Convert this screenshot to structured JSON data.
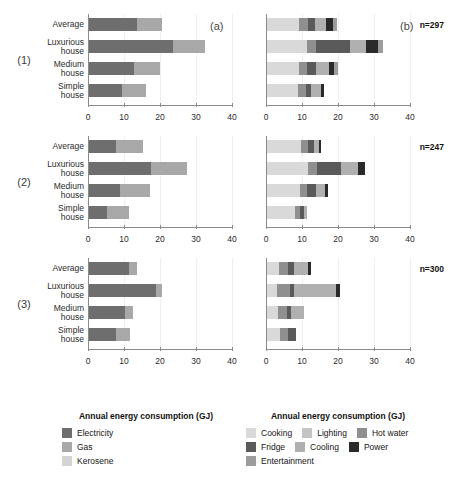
{
  "chart_data": {
    "type": "bar",
    "title": "",
    "xlabel": "Annual energy consumption (GJ)",
    "ylabel": "",
    "xlim": [
      0,
      40
    ],
    "xticks": [
      0,
      10,
      20,
      30,
      40
    ],
    "categories": [
      "Average",
      "Luxurious\nhouse",
      "Medium\nhouse",
      "Simple\nhouse"
    ],
    "grid": false,
    "legend_position": "bottom",
    "panel_tags": [
      "(a)",
      "(b)"
    ],
    "groups": [
      {
        "id": "(1)",
        "n_label": "n=297",
        "panel_a": {
          "tag": "(a)",
          "stacks": [
            "Electricity",
            "Gas",
            "Kerosene"
          ],
          "values": [
            [
              13.2,
              7.2,
              0.0
            ],
            [
              23.3,
              8.9,
              0.0
            ],
            [
              12.4,
              7.2,
              0.0
            ],
            [
              9.1,
              6.7,
              0.0
            ]
          ],
          "totals": [
            20.4,
            32.2,
            19.6,
            15.8
          ]
        },
        "panel_b": {
          "tag": "(b)",
          "stacks": [
            "Cooking",
            "Lighting",
            "Hot water",
            "Fridge",
            "Cooling",
            "Power",
            "Entertainment"
          ],
          "values": [
            [
              9.0,
              0.0,
              2.3,
              2.0,
              3.2,
              1.9,
              1.0
            ],
            [
              11.2,
              0.0,
              2.4,
              9.4,
              4.6,
              3.3,
              1.3
            ],
            [
              8.8,
              0.0,
              2.3,
              2.5,
              3.5,
              1.6,
              0.9
            ],
            [
              8.7,
              0.0,
              2.0,
              1.6,
              2.6,
              0.9,
              0.0
            ]
          ],
          "totals": [
            19.4,
            32.2,
            19.6,
            15.8
          ]
        }
      },
      {
        "id": "(2)",
        "n_label": "n=247",
        "panel_a": {
          "tag": "",
          "stacks": [
            "Electricity",
            "Gas",
            "Kerosene"
          ],
          "values": [
            [
              7.5,
              7.6,
              0.0
            ],
            [
              17.2,
              10.0,
              0.0
            ],
            [
              8.6,
              8.3,
              0.0
            ],
            [
              5.1,
              6.0,
              0.0
            ]
          ],
          "totals": [
            15.1,
            27.2,
            16.9,
            11.1
          ]
        },
        "panel_b": {
          "tag": "",
          "stacks": [
            "Cooking",
            "Lighting",
            "Hot water",
            "Fridge",
            "Cooling",
            "Power",
            "Entertainment"
          ],
          "values": [
            [
              9.4,
              0.0,
              2.1,
              1.7,
              1.2,
              0.7,
              0.0
            ],
            [
              11.3,
              0.0,
              2.6,
              6.7,
              4.6,
              2.0,
              0.0
            ],
            [
              9.2,
              0.0,
              2.0,
              2.3,
              2.5,
              0.9,
              0.0
            ],
            [
              7.7,
              0.0,
              1.5,
              1.1,
              0.8,
              0.0,
              0.0
            ]
          ],
          "totals": [
            15.1,
            27.2,
            16.9,
            11.1
          ]
        }
      },
      {
        "id": "(3)",
        "n_label": "n=300",
        "panel_a": {
          "tag": "",
          "stacks": [
            "Electricity",
            "Gas",
            "Kerosene"
          ],
          "values": [
            [
              11.0,
              2.2,
              0.0
            ],
            [
              18.6,
              1.6,
              0.0
            ],
            [
              10.1,
              2.2,
              0.0
            ],
            [
              7.4,
              4.1,
              0.0
            ]
          ],
          "totals": [
            13.2,
            20.2,
            12.3,
            11.5
          ]
        },
        "panel_b": {
          "tag": "",
          "stacks": [
            "Cooking",
            "Lighting",
            "Hot water",
            "Fridge",
            "Cooling",
            "Power",
            "Entertainment"
          ],
          "values": [
            [
              3.2,
              0.0,
              2.7,
              1.5,
              3.9,
              0.8,
              0.0
            ],
            [
              2.9,
              0.0,
              3.4,
              1.3,
              11.5,
              1.1,
              0.0
            ],
            [
              3.0,
              0.0,
              2.5,
              1.3,
              3.5,
              0.0,
              0.0
            ],
            [
              3.6,
              0.0,
              2.1,
              2.5,
              0.0,
              0.0,
              0.0
            ]
          ],
          "totals": [
            12.1,
            20.2,
            10.3,
            8.2
          ]
        }
      }
    ]
  },
  "legend_left": {
    "title": "Annual energy consumption (GJ)",
    "items": [
      {
        "label": "Electricity",
        "color": "#6e6e6e"
      },
      {
        "label": "Gas",
        "color": "#a8a8a8"
      },
      {
        "label": "Kerosene",
        "color": "#d4d4d4"
      }
    ]
  },
  "legend_right": {
    "title": "Annual energy consumption (GJ)",
    "items": [
      {
        "label": "Cooking",
        "color": "#d9d9d9"
      },
      {
        "label": "Lighting",
        "color": "#c4c4c4"
      },
      {
        "label": "Hot water",
        "color": "#8f8f8f"
      },
      {
        "label": "Fridge",
        "color": "#5a5a5a"
      },
      {
        "label": "Cooling",
        "color": "#b0b0b0"
      },
      {
        "label": "Power",
        "color": "#2a2a2a"
      },
      {
        "label": "Entertainment",
        "color": "#9c9c9c"
      }
    ]
  }
}
